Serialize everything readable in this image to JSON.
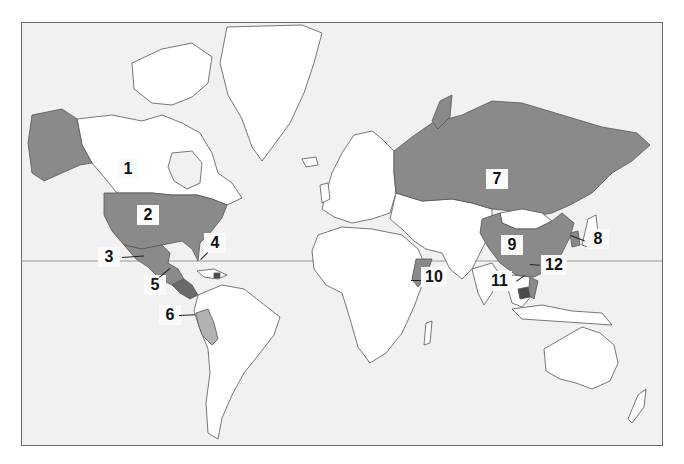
{
  "map": {
    "projection": "Mercator world map",
    "colors": {
      "ocean": "#f1f1f1",
      "land": "#ffffff",
      "highlight": "#8a8a8a",
      "highlight_light": "#b2b2b2",
      "highlight_dark": "#4a4a4a",
      "border": "#555555",
      "equator": "#9a9a9a",
      "frame": "#6a6a6a"
    },
    "equator_label": "",
    "markers": [
      {
        "number": "1",
        "region": "Canada"
      },
      {
        "number": "2",
        "region": "United States"
      },
      {
        "number": "3",
        "region": "Mexico"
      },
      {
        "number": "4",
        "region": "Haiti / Caribbean"
      },
      {
        "number": "5",
        "region": "Central America"
      },
      {
        "number": "6",
        "region": "Peru"
      },
      {
        "number": "7",
        "region": "Russia"
      },
      {
        "number": "8",
        "region": "Korea"
      },
      {
        "number": "9",
        "region": "China"
      },
      {
        "number": "10",
        "region": "Somalia"
      },
      {
        "number": "11",
        "region": "Cambodia"
      },
      {
        "number": "12",
        "region": "Vietnam"
      }
    ]
  }
}
